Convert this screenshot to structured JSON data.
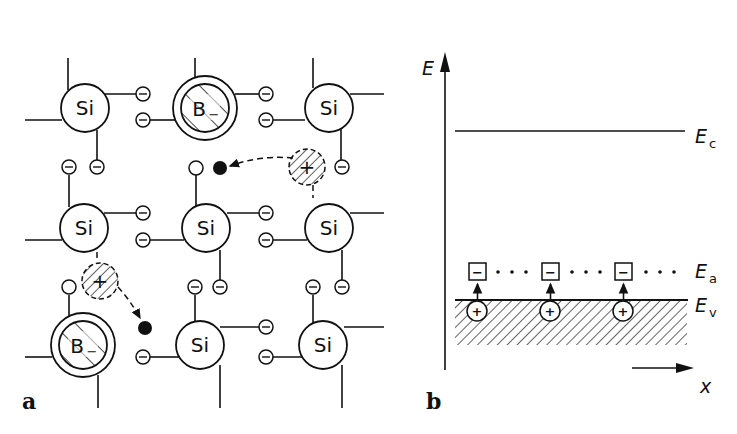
{
  "panel_a": {
    "label": "a",
    "silicon_label": "Si",
    "boron_label": "B",
    "boron_charge": "−",
    "electron_symbol": "−",
    "hole_symbol": "+",
    "atoms": [
      {
        "type": "Si",
        "x": 85,
        "y": 108
      },
      {
        "type": "B",
        "x": 205,
        "y": 108
      },
      {
        "type": "Si",
        "x": 329,
        "y": 108
      },
      {
        "type": "Si",
        "x": 84,
        "y": 228
      },
      {
        "type": "Si",
        "x": 206,
        "y": 228
      },
      {
        "type": "Si",
        "x": 329,
        "y": 228
      },
      {
        "type": "B",
        "x": 83,
        "y": 345
      },
      {
        "type": "Si",
        "x": 200,
        "y": 345
      },
      {
        "type": "Si",
        "x": 323,
        "y": 345
      }
    ]
  },
  "panel_b": {
    "label": "b",
    "y_axis_label": "E",
    "x_axis_label": "x",
    "levels": [
      {
        "name": "E",
        "sub": "c",
        "desc": "conduction band edge"
      },
      {
        "name": "E",
        "sub": "a",
        "desc": "acceptor level"
      },
      {
        "name": "E",
        "sub": "v",
        "desc": "valence band edge"
      }
    ],
    "acceptor_symbol": "−",
    "hole_symbol": "+",
    "acceptor_count": 3
  }
}
